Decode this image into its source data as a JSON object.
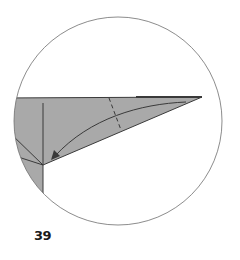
{
  "diagram": {
    "type": "origami-step",
    "step_number": "39",
    "colors": {
      "paper": "#a9a9a9",
      "line": "#3a3a3a",
      "circle": "#6e6e6e",
      "background": "#ffffff"
    },
    "elements": [
      "circular detail view",
      "gray folded paper flap (triangle)",
      "valley fold dashed line",
      "curved fold arrow toward left vertex",
      "crease lines at left"
    ]
  }
}
